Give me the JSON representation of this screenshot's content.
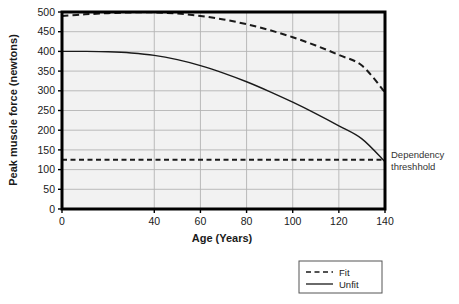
{
  "chart_data": {
    "type": "line",
    "title": "",
    "xlabel": "Age (Years)",
    "ylabel": "Peak muscle force (newtons)",
    "xlim": [
      0,
      140
    ],
    "ylim": [
      0,
      500
    ],
    "xticks": [
      0,
      40,
      60,
      80,
      100,
      120,
      140
    ],
    "xtick_labels": [
      "0",
      "40",
      "60",
      "80",
      "100",
      "120",
      "140"
    ],
    "yticks": [
      0,
      50,
      100,
      150,
      200,
      250,
      300,
      350,
      400,
      450,
      500
    ],
    "ytick_labels": [
      "0",
      "50",
      "100",
      "150",
      "200",
      "250",
      "300",
      "350",
      "400",
      "450",
      "500"
    ],
    "grid": true,
    "grid_color": "#b4b4b4",
    "plot_background": "#f2f2f2",
    "axis_color": "#000000",
    "legend_position": "below-right",
    "series": [
      {
        "name": "Fit",
        "style": "dashed",
        "color": "#1a1a1a",
        "x": [
          0,
          10,
          20,
          30,
          40,
          50,
          60,
          70,
          80,
          90,
          100,
          110,
          120,
          130,
          140
        ],
        "values": [
          490,
          494,
          497,
          499,
          499,
          496,
          490,
          481,
          469,
          454,
          436,
          415,
          391,
          364,
          296
        ]
      },
      {
        "name": "Unfit",
        "style": "solid",
        "color": "#1a1a1a",
        "x": [
          0,
          10,
          20,
          30,
          40,
          50,
          60,
          70,
          80,
          90,
          100,
          110,
          120,
          130,
          140
        ],
        "values": [
          400,
          400,
          399,
          396,
          390,
          379,
          364,
          345,
          323,
          298,
          271,
          242,
          211,
          178,
          120
        ]
      }
    ],
    "reference_lines": [
      {
        "name": "Dependency threshhold",
        "orientation": "horizontal",
        "value": 125,
        "style": "dashed",
        "color": "#1a1a1a",
        "label_line1": "Dependency",
        "label_line2": "threshhold"
      }
    ],
    "annotations": {
      "threshold_label_line1": "Dependency",
      "threshold_label_line2": "threshhold"
    }
  },
  "legend": {
    "entries": [
      {
        "label": "Fit",
        "style": "dashed"
      },
      {
        "label": "Unfit",
        "style": "solid"
      }
    ]
  }
}
